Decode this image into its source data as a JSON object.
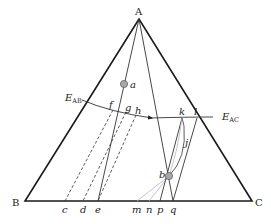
{
  "diagram": {
    "type": "ternary phase diagram",
    "vertices": {
      "A": {
        "label": "A",
        "x": 139,
        "y": 19
      },
      "B": {
        "label": "B",
        "x": 25,
        "y": 201
      },
      "C": {
        "label": "C",
        "x": 252,
        "y": 201
      }
    },
    "eutectics": {
      "E_AB": {
        "main": "E",
        "sub": "AB",
        "x": 82,
        "y": 100
      },
      "E_AC": {
        "main": "E",
        "sub": "AC",
        "x": 213,
        "y": 117
      }
    },
    "points": {
      "a": {
        "label": "a",
        "x": 124,
        "y": 84
      },
      "b": {
        "label": "b",
        "x": 169,
        "y": 176
      },
      "f": {
        "label": "f",
        "x": 113,
        "y": 110
      },
      "g": {
        "label": "g",
        "x": 128,
        "y": 113
      },
      "h": {
        "label": "h",
        "x": 137,
        "y": 116
      },
      "j": {
        "label": "j",
        "x": 186,
        "y": 144
      },
      "k": {
        "label": "k",
        "x": 182,
        "y": 118
      },
      "l": {
        "label": "l",
        "x": 197,
        "y": 118
      }
    },
    "base_points": {
      "c": {
        "label": "c",
        "x": 65
      },
      "d": {
        "label": "d",
        "x": 83
      },
      "e": {
        "label": "e",
        "x": 98
      },
      "m": {
        "label": "m",
        "x": 137
      },
      "n": {
        "label": "n",
        "x": 149
      },
      "p": {
        "label": "p",
        "x": 160
      },
      "q": {
        "label": "q",
        "x": 173
      }
    },
    "colors": {
      "line": "#1a1a1a",
      "thin_line": "#333333",
      "light_line": "#b5b5b5",
      "point_fill": "#a8a8a8",
      "point_stroke": "#555555"
    }
  }
}
